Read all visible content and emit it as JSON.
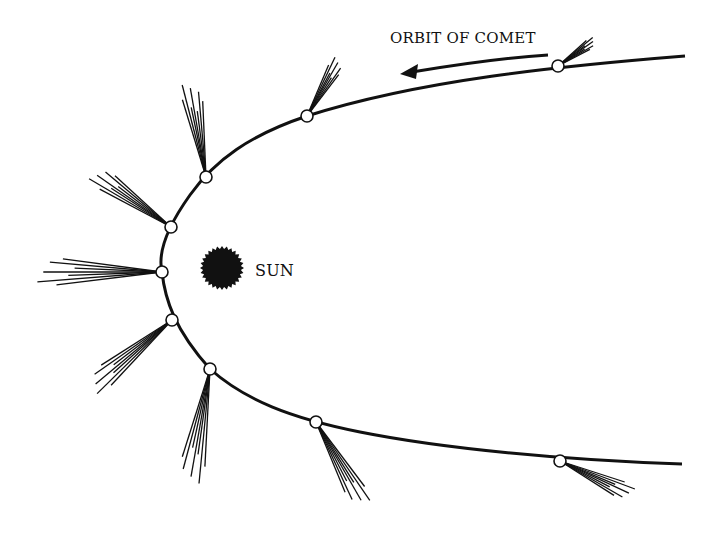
{
  "diagram": {
    "orbit_label": "ORBIT OF COMET",
    "sun_label": "SUN",
    "colors": {
      "ink": "#111111",
      "background": "#ffffff",
      "comet_fill": "#ffffff"
    },
    "sun": {
      "x": 222,
      "y": 268,
      "radius": 20
    },
    "comet_positions": [
      {
        "x": 558,
        "y": 66,
        "tail_angle": -35,
        "tail_length": 45
      },
      {
        "x": 307,
        "y": 116,
        "tail_angle": -60,
        "tail_length": 65
      },
      {
        "x": 206,
        "y": 177,
        "tail_angle": -100,
        "tail_length": 95
      },
      {
        "x": 171,
        "y": 227,
        "tail_angle": -145,
        "tail_length": 95
      },
      {
        "x": 162,
        "y": 272,
        "tail_angle": 180,
        "tail_length": 125
      },
      {
        "x": 172,
        "y": 320,
        "tail_angle": 140,
        "tail_length": 105
      },
      {
        "x": 210,
        "y": 369,
        "tail_angle": 100,
        "tail_length": 115
      },
      {
        "x": 316,
        "y": 422,
        "tail_angle": 60,
        "tail_length": 95
      },
      {
        "x": 560,
        "y": 461,
        "tail_angle": 25,
        "tail_length": 80
      }
    ]
  }
}
